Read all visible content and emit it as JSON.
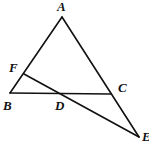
{
  "diagram": {
    "points": {
      "A": {
        "label": "A",
        "x": 62,
        "y": 17
      },
      "F": {
        "label": "F",
        "x": 24,
        "y": 74
      },
      "B": {
        "label": "B",
        "x": 10,
        "y": 93
      },
      "D": {
        "label": "D",
        "x": 61,
        "y": 94
      },
      "C": {
        "label": "C",
        "x": 111,
        "y": 94
      },
      "E": {
        "label": "E",
        "x": 139,
        "y": 137
      }
    },
    "segments": [
      {
        "from": "A",
        "to": "B",
        "name": "AB"
      },
      {
        "from": "A",
        "to": "E",
        "name": "AE"
      },
      {
        "from": "B",
        "to": "C",
        "name": "BC"
      },
      {
        "from": "F",
        "to": "E",
        "name": "FE"
      }
    ],
    "labels": {
      "A": "A",
      "F": "F",
      "B": "B",
      "D": "D",
      "C": "C",
      "E": "E"
    }
  }
}
